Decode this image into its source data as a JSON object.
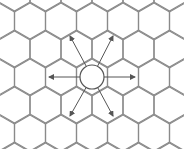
{
  "diagram": {
    "type": "hexagonal-grid",
    "colors": {
      "background": "#ffffff",
      "grid": "#8a8a8a",
      "arrow": "#555555",
      "circle": "#555555"
    },
    "center": {
      "x": 92,
      "y": 77,
      "radius": 12
    },
    "arrows": [
      {
        "to": "upper-left",
        "x": 70,
        "y": 36
      },
      {
        "to": "upper-right",
        "x": 113,
        "y": 36
      },
      {
        "to": "left",
        "x": 49,
        "y": 77
      },
      {
        "to": "right",
        "x": 135,
        "y": 77
      },
      {
        "to": "lower-left",
        "x": 70,
        "y": 116
      },
      {
        "to": "lower-right",
        "x": 113,
        "y": 116
      }
    ]
  }
}
